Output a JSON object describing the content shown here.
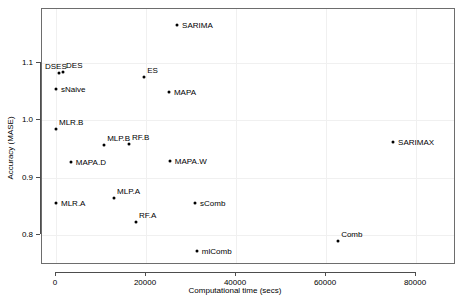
{
  "chart_data": {
    "type": "scatter",
    "title": "",
    "xlabel": "Computational time (secs)",
    "ylabel": "Accuracy (MASE)",
    "xlim": [
      -5000,
      90000
    ],
    "ylim": [
      0.755,
      1.185
    ],
    "xticks": [
      0,
      20000,
      40000,
      60000,
      80000
    ],
    "xticklabels": [
      "0",
      "20000",
      "40000",
      "60000",
      "80000"
    ],
    "yticks": [
      0.8,
      0.9,
      1.0,
      1.1
    ],
    "yticklabels": [
      "0.8",
      "0.9",
      "1.0",
      "1.1"
    ],
    "grid": true,
    "legend": null,
    "points": [
      {
        "label": "SARIMA",
        "x": 26900,
        "y": 1.166,
        "label_pos": "right"
      },
      {
        "label": "DSES",
        "x": 670,
        "y": 1.083,
        "label_pos": "above-left"
      },
      {
        "label": "DES",
        "x": 1560,
        "y": 1.085,
        "label_pos": "above-right"
      },
      {
        "label": "sNaive",
        "x": 0,
        "y": 1.055,
        "label_pos": "right"
      },
      {
        "label": "ES",
        "x": 19600,
        "y": 1.075,
        "label_pos": "above-right"
      },
      {
        "label": "MAPA",
        "x": 25100,
        "y": 1.049,
        "label_pos": "right"
      },
      {
        "label": "MLR.B",
        "x": 0,
        "y": 0.985,
        "label_pos": "above-right"
      },
      {
        "label": "MLP.B",
        "x": 10700,
        "y": 0.957,
        "label_pos": "above-right"
      },
      {
        "label": "RF.B",
        "x": 16200,
        "y": 0.959,
        "label_pos": "above-right"
      },
      {
        "label": "MAPA.D",
        "x": 3300,
        "y": 0.928,
        "label_pos": "right"
      },
      {
        "label": "MAPA.W",
        "x": 25300,
        "y": 0.929,
        "label_pos": "right"
      },
      {
        "label": "MLR.A",
        "x": 0,
        "y": 0.856,
        "label_pos": "right"
      },
      {
        "label": "MLP.A",
        "x": 12900,
        "y": 0.864,
        "label_pos": "above-right"
      },
      {
        "label": "sComb",
        "x": 30900,
        "y": 0.856,
        "label_pos": "right"
      },
      {
        "label": "RF.A",
        "x": 17800,
        "y": 0.823,
        "label_pos": "above-right"
      },
      {
        "label": "mlComb",
        "x": 31300,
        "y": 0.772,
        "label_pos": "right"
      },
      {
        "label": "Comb",
        "x": 62700,
        "y": 0.79,
        "label_pos": "above-right"
      },
      {
        "label": "SARIMAX",
        "x": 74900,
        "y": 0.962,
        "label_pos": "right"
      }
    ]
  }
}
